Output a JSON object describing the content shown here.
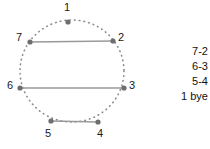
{
  "diagram": {
    "type": "round-robin-circle",
    "circle": {
      "center_x": 72,
      "center_y": 71,
      "radius_x": 52,
      "radius_y": 51,
      "stroke_style": "dotted",
      "color": "#8a8a8a"
    },
    "node_color": "#6e6e72",
    "chord_color": "#9a9a9e",
    "nodes": [
      {
        "label": "1",
        "x": 68,
        "y": 22,
        "label_x": 64,
        "label_y": 2
      },
      {
        "label": "2",
        "x": 113,
        "y": 41,
        "label_x": 118,
        "label_y": 32
      },
      {
        "label": "3",
        "x": 124,
        "y": 88,
        "label_x": 129,
        "label_y": 80
      },
      {
        "label": "4",
        "x": 98,
        "y": 122,
        "label_x": 97,
        "label_y": 128
      },
      {
        "label": "5",
        "x": 51,
        "y": 121,
        "label_x": 45,
        "label_y": 128
      },
      {
        "label": "6",
        "x": 20,
        "y": 88,
        "label_x": 7,
        "label_y": 80
      },
      {
        "label": "7",
        "x": 30,
        "y": 42,
        "label_x": 16,
        "label_y": 32
      }
    ],
    "chords": [
      {
        "name": "chord-7-2",
        "from": "7",
        "to": "2",
        "x1": 30,
        "y1": 42,
        "x2": 113,
        "y2": 41
      },
      {
        "name": "chord-6-3",
        "from": "6",
        "to": "3",
        "x1": 20,
        "y1": 88,
        "x2": 124,
        "y2": 88
      },
      {
        "name": "chord-5-4",
        "from": "5",
        "to": "4",
        "x1": 51,
        "y1": 121,
        "x2": 98,
        "y2": 122
      }
    ]
  },
  "pairings": {
    "items": [
      {
        "label": "7-2"
      },
      {
        "label": "6-3"
      },
      {
        "label": "5-4"
      },
      {
        "label": "1 bye"
      }
    ]
  }
}
